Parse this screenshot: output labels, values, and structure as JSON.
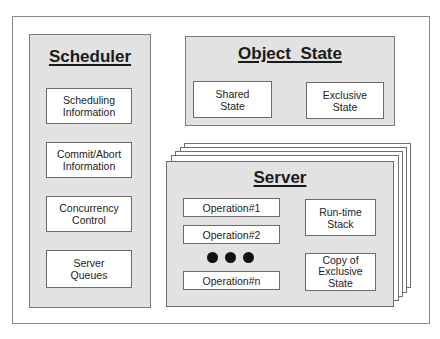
{
  "diagram": {
    "scheduler": {
      "title": "Scheduler",
      "items": [
        {
          "label": "Scheduling\nInformation"
        },
        {
          "label": "Commit/Abort\nInformation"
        },
        {
          "label": "Concurrency\nControl"
        },
        {
          "label": "Server\nQueues"
        }
      ]
    },
    "object_state": {
      "title": "Object  State",
      "items": [
        {
          "label": "Shared\nState"
        },
        {
          "label": "Exclusive\nState"
        }
      ]
    },
    "server": {
      "title": "Server",
      "stack_count": 5,
      "operations": [
        {
          "label": "Operation#1"
        },
        {
          "label": "Operation#2"
        },
        {
          "label": "Operation#n"
        }
      ],
      "ellipsis": "● ● ●",
      "right_items": [
        {
          "label": "Run-time\nStack"
        },
        {
          "label": "Copy of\nExclusive\nState"
        }
      ]
    },
    "colors": {
      "panel_fill": "#e2e2e2",
      "box_fill": "#ffffff",
      "border": "#6e6e6e"
    }
  }
}
